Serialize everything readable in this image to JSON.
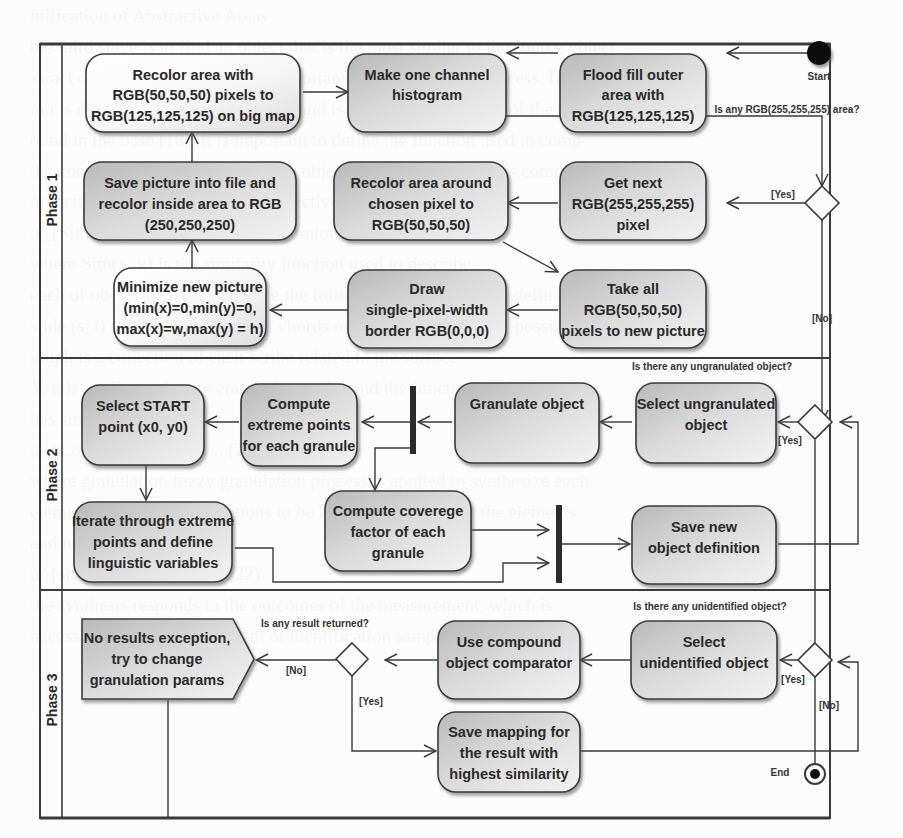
{
  "diagram": {
    "type": "uml-activity",
    "lanes": [
      {
        "label": "Phase 1"
      },
      {
        "label": "Phase 2"
      },
      {
        "label": "Phase 3"
      }
    ],
    "start_label": "Start",
    "end_label": "End",
    "phase1": {
      "recolor_big_map": [
        "Recolor area with",
        "RGB(50,50,50) pixels to",
        "RGB(125,125,125) on big map"
      ],
      "histogram": [
        "Make one channel",
        "histogram"
      ],
      "flood_fill": [
        "Flood fill outer",
        "area with",
        "RGB(125,125,125)"
      ],
      "save_picture": [
        "Save picture into file and",
        "recolor inside area to RGB",
        "(250,250,250)"
      ],
      "recolor_around": [
        "Recolor area around",
        "chosen pixel to",
        "RGB(50,50,50)"
      ],
      "get_next": [
        "Get next",
        "RGB(255,255,255)",
        "pixel"
      ],
      "minimize": [
        "Minimize new picture",
        "(min(x)=0,min(y)=0,",
        "max(x)=w,max(y) = h)"
      ],
      "draw_border": [
        "Draw",
        "single-pixel-width",
        "border RGB(0,0,0)"
      ],
      "take_all": [
        "Take all",
        "RGB(50,50,50)",
        "pixels to new picture"
      ],
      "decision_question": "Is any RGB(255,255,255) area?",
      "yes": "[Yes]",
      "no": "[No]"
    },
    "phase2": {
      "select_start": [
        "Select START",
        "point (x0, y0)"
      ],
      "compute_extreme": [
        "Compute",
        "extreme points",
        "for each granule"
      ],
      "granulate": [
        "Granulate object"
      ],
      "select_ungranulated": [
        "Select ungranulated",
        "object"
      ],
      "iterate": [
        "Iterate through extreme",
        "points and define",
        "linguistic variables"
      ],
      "coverage": [
        "Compute coverege",
        "factor of each",
        "granule"
      ],
      "save_definition": [
        "Save new",
        "object definition"
      ],
      "decision_question": "Is there any ungranulated object?",
      "yes": "[Yes]"
    },
    "phase3": {
      "no_results": [
        "No results exception,",
        "try to change",
        "granulation params"
      ],
      "compound": [
        "Use compound",
        "object comparator"
      ],
      "select_unidentified": [
        "Select",
        "unidentified object"
      ],
      "save_mapping": [
        "Save mapping for",
        "the result with",
        "highest similarity"
      ],
      "result_question": "Is any result returned?",
      "unidentified_question": "Is there any unidentified object?",
      "no_result_label": "[No]",
      "yes_result_label": "[Yes]",
      "yes_unidentified": "[Yes]",
      "no_unidentified": "[No]"
    },
    "colors": {
      "node_fill_light": "#fdfdfd",
      "node_fill_dark": "#c8c8c8",
      "stroke": "#3a3a3a",
      "bar": "#2b2b2b"
    }
  },
  "background_text": [
    "ntification of Abstractive Areas",
    "ble third stage is to find an object that is the most similar to the source object",
    "xtract object, which is the most important step in the entire process. In first",
    "ion is defining of the source object and is contrasted with each of the objects in",
    "ound in the base [18]. It is important to define the function used in comp",
    "the comparison of the shape of two objects and the one which is compared",
    "njunction [19] of the particular objectives of the comparison",
    "",
    "    μ_{Sim}(x,y) = ∧ μ_{Sim}(comparator(s_i), ...)    (20)",
    "",
    "where Sim(x, y) is the similarity function used to describe",
    "each of objects and we introduce the following functions in the definition",
    "slide (s_i) refers to the length of chords of the observation. It is possible",
    "graph is a collection of each scribe related to the surface",
    "Y, it is similar to the coverage of granules and the functional relationship",
    "has similarity function",
    "",
    "         μ_{Cov}(x,y) = ∧ ... μ ...   (21)",
    "",
    "where granulation fuzzy granulation process is applied to synthesize each",
    "elements, and both granulations to be based on the level of the elements",
    "and need to be used",
    "",
    "      μ^{shape}(x, y) = ... ∧ ...   (22)",
    "",
    "the synthesis responds to the outcomes of the measurement, which is",
    "necessary to solve the problem of identification sample network with its"
  ]
}
